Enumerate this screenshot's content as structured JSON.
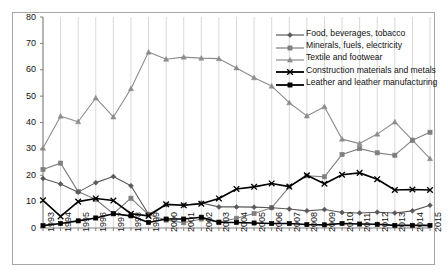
{
  "chart_data": {
    "type": "line",
    "title": "",
    "xlabel": "",
    "ylabel": "",
    "grid": "vertical",
    "legend_position": "top-right",
    "xlim": [
      1993,
      2015
    ],
    "ylim": [
      0,
      80
    ],
    "ytick_step": 10,
    "yticks": [
      "0",
      "10",
      "20",
      "30",
      "40",
      "50",
      "60",
      "70",
      "80"
    ],
    "categories": [
      "1993",
      "1994",
      "1995",
      "1996",
      "1997",
      "1998",
      "1999",
      "2000",
      "2001",
      "2002",
      "2003",
      "2004",
      "2005",
      "2006",
      "2007",
      "2008",
      "2009",
      "2010",
      "2011",
      "2012",
      "2013",
      "2014",
      "2015"
    ],
    "series": [
      {
        "name": "Food, beverages, tobacco",
        "color": "#595959",
        "marker": "diamond",
        "values": [
          18.8,
          16.7,
          13.6,
          17.2,
          19.5,
          16.0,
          5.2,
          8.8,
          8.6,
          9.5,
          8.0,
          8.0,
          7.9,
          7.7,
          7.2,
          6.5,
          7.0,
          5.9,
          5.7,
          6.0,
          5.7,
          6.5,
          8.6
        ]
      },
      {
        "name": "Minerals, fuels, electricity",
        "color": "#7f7f7f",
        "marker": "square",
        "values": [
          22.2,
          24.6,
          13.8,
          10.8,
          5.4,
          11.3,
          5.0,
          3.0,
          2.0,
          3.4,
          2.2,
          3.7,
          5.5,
          7.7,
          15.6,
          19.8,
          19.4,
          27.9,
          30.1,
          28.5,
          27.6,
          33.3,
          36.3
        ]
      },
      {
        "name": "Textile and footwear",
        "color": "#8c8c8c",
        "marker": "triangle",
        "values": [
          30.3,
          42.4,
          40.3,
          49.3,
          42.1,
          52.8,
          66.7,
          64.0,
          64.8,
          64.4,
          64.2,
          60.7,
          57.0,
          53.8,
          47.5,
          42.5,
          46.0,
          33.7,
          32.0,
          35.6,
          40.2,
          33.3,
          26.3
        ]
      },
      {
        "name": "Construction materials and metals",
        "color": "#000000",
        "marker": "cross",
        "values": [
          10.5,
          4.4,
          10.0,
          11.2,
          10.4,
          5.4,
          4.6,
          9.0,
          8.6,
          9.2,
          11.2,
          14.8,
          15.6,
          16.9,
          15.7,
          20.0,
          16.8,
          20.2,
          20.9,
          18.5,
          14.4,
          14.6,
          14.4
        ]
      },
      {
        "name": "Leather and leather manufacturing",
        "color": "#000000",
        "marker": "square",
        "values": [
          0.9,
          1.7,
          2.7,
          3.8,
          5.4,
          4.6,
          2.1,
          3.4,
          3.4,
          4.1,
          2.2,
          2.1,
          1.9,
          1.7,
          1.7,
          1.3,
          1.2,
          1.7,
          1.5,
          1.4,
          1.0,
          1.0,
          1.0
        ]
      }
    ]
  }
}
